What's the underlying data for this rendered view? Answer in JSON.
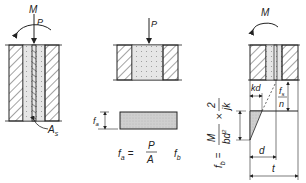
{
  "panels": [
    {
      "id": "panel-1",
      "labels": {
        "moment": "M",
        "load": "P",
        "steel_area": "A",
        "steel_area_sub": "s"
      }
    },
    {
      "id": "panel-2",
      "labels": {
        "load": "P",
        "stress_height": "f",
        "stress_height_sub": "a",
        "eq_lhs": "f",
        "eq_lhs_sub": "a",
        "eq_equals": "=",
        "eq_num": "P",
        "eq_den": "A",
        "fb": "f",
        "fb_sub": "b"
      }
    },
    {
      "id": "panel-3",
      "labels": {
        "moment": "M",
        "kd": "kd",
        "fs": "f",
        "fs_sub": "s",
        "n": "n",
        "d": "d",
        "t": "t",
        "formula_lhs": "f",
        "formula_lhs_sub": "b",
        "formula_eq": "=",
        "formula_num1": "M",
        "formula_den1": "bd",
        "formula_den1_sup": "2",
        "formula_times": "×",
        "formula_num2": "2",
        "formula_den2": "jk"
      }
    }
  ],
  "colors": {
    "line": "#222222",
    "fill": "#d8d8d8",
    "hatch": "#333333"
  }
}
